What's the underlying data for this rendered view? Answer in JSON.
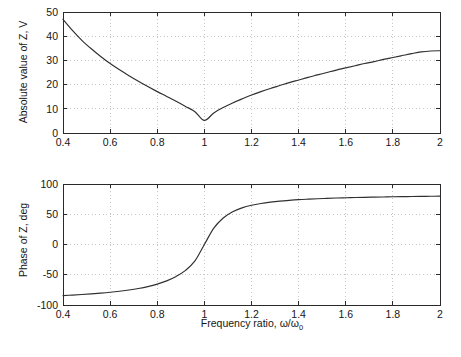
{
  "figure": {
    "title": "",
    "background_color": "#ffffff",
    "curve_color": "#303030",
    "grid_color": "#b9b9b9",
    "axis_color": "#2a2a2a"
  },
  "chart_data": [
    {
      "type": "line",
      "id": "magnitude",
      "title": "",
      "xlabel": "",
      "ylabel": "Absolute value of Z, V",
      "xlim": [
        0.4,
        2
      ],
      "ylim": [
        0,
        50
      ],
      "xticks": [
        0.4,
        0.6,
        0.8,
        1,
        1.2,
        1.4,
        1.6,
        1.8,
        2
      ],
      "xticklabels": [
        "0.4",
        "0.6",
        "0.8",
        "1",
        "1.2",
        "1.4",
        "1.6",
        "1.8",
        "2"
      ],
      "yticks": [
        0,
        10,
        20,
        30,
        40,
        50
      ],
      "yticklabels": [
        "0",
        "10",
        "20",
        "30",
        "40",
        "50"
      ],
      "grid": true,
      "legend": null,
      "series": [
        {
          "name": "|Z|",
          "x": [
            0.4,
            0.44,
            0.48,
            0.52,
            0.56,
            0.6,
            0.64,
            0.68,
            0.72,
            0.76,
            0.8,
            0.84,
            0.88,
            0.92,
            0.96,
            1.0,
            1.04,
            1.08,
            1.12,
            1.16,
            1.2,
            1.24,
            1.28,
            1.32,
            1.36,
            1.4,
            1.44,
            1.48,
            1.52,
            1.56,
            1.6,
            1.64,
            1.68,
            1.72,
            1.76,
            1.8,
            1.84,
            1.88,
            1.92,
            1.96,
            2.0
          ],
          "y": [
            47.0,
            42.4,
            38.3,
            34.8,
            31.6,
            28.7,
            26.1,
            23.7,
            21.4,
            19.2,
            17.1,
            15.1,
            13.1,
            11.0,
            8.8,
            5.2,
            8.3,
            10.5,
            12.4,
            14.1,
            15.7,
            17.1,
            18.4,
            19.6,
            20.8,
            21.9,
            23.0,
            24.0,
            25.0,
            26.0,
            26.9,
            27.8,
            28.7,
            29.5,
            30.4,
            31.2,
            32.0,
            32.8,
            33.5,
            33.9,
            34.0
          ]
        }
      ]
    },
    {
      "type": "line",
      "id": "phase",
      "title": "",
      "xlabel": "Frequency ratio, ω/ω₀",
      "ylabel": "Phase of Z, deg",
      "xlim": [
        0.4,
        2
      ],
      "ylim": [
        -100,
        100
      ],
      "xticks": [
        0.4,
        0.6,
        0.8,
        1,
        1.2,
        1.4,
        1.6,
        1.8,
        2
      ],
      "xticklabels": [
        "0.4",
        "0.6",
        "0.8",
        "1",
        "1.2",
        "1.4",
        "1.6",
        "1.8",
        "2"
      ],
      "yticks": [
        -100,
        -50,
        0,
        50,
        100
      ],
      "yticklabels": [
        "-100",
        "-50",
        "0",
        "50",
        "100"
      ],
      "grid": true,
      "legend": null,
      "series": [
        {
          "name": "arg(Z)",
          "x": [
            0.4,
            0.44,
            0.48,
            0.52,
            0.56,
            0.6,
            0.64,
            0.68,
            0.72,
            0.76,
            0.8,
            0.84,
            0.88,
            0.92,
            0.96,
            1.0,
            1.04,
            1.08,
            1.12,
            1.16,
            1.2,
            1.24,
            1.28,
            1.32,
            1.36,
            1.4,
            1.44,
            1.48,
            1.52,
            1.56,
            1.6,
            1.64,
            1.68,
            1.72,
            1.76,
            1.8,
            1.84,
            1.88,
            1.92,
            1.96,
            2.0
          ],
          "y": [
            -84.5,
            -83.6,
            -82.6,
            -81.5,
            -80.3,
            -78.9,
            -77.2,
            -75.2,
            -72.7,
            -69.6,
            -65.5,
            -60.1,
            -52.8,
            -42.8,
            -27.2,
            0.0,
            27.0,
            43.8,
            54.0,
            60.5,
            64.8,
            67.8,
            70.0,
            71.7,
            73.0,
            74.1,
            74.9,
            75.6,
            76.2,
            76.8,
            77.2,
            77.6,
            78.0,
            78.3,
            78.6,
            78.9,
            79.1,
            79.3,
            79.5,
            79.7,
            79.9
          ]
        }
      ]
    }
  ],
  "axis_labels": {
    "magnitude_y": "Absolute value of Z, V",
    "phase_y": "Phase of Z, deg",
    "x_prefix": "Frequency ratio, ",
    "x_symbol_num": "ω",
    "x_symbol_slash": "/",
    "x_symbol_den": "ω",
    "x_symbol_sub": "0"
  }
}
